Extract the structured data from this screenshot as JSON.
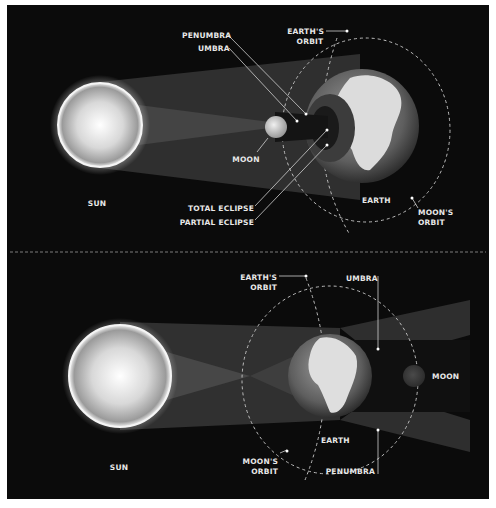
{
  "diagram": {
    "colors": {
      "background": "#0b0b0b",
      "frame": "#ffffff",
      "label": "#e8e8e8",
      "leader_line": "#cfcfcf",
      "penumbra": "#3a3a3a",
      "umbra": "#1a1a1a",
      "orbit": "#bdbdbd"
    },
    "solar_eclipse": {
      "labels": {
        "sun": "SUN",
        "moon": "MOON",
        "earth": "EARTH",
        "penumbra": "PENUMBRA",
        "umbra": "UMBRA",
        "earths_orbit_1": "EARTH'S",
        "earths_orbit_2": "ORBIT",
        "moons_orbit_1": "MOON'S",
        "moons_orbit_2": "ORBIT",
        "total_eclipse": "TOTAL ECLIPSE",
        "partial_eclipse": "PARTIAL ECLIPSE"
      }
    },
    "lunar_eclipse": {
      "labels": {
        "sun": "SUN",
        "moon": "MOON",
        "earth": "EARTH",
        "umbra": "UMBRA",
        "penumbra": "PENUMBRA",
        "earths_orbit_1": "EARTH'S",
        "earths_orbit_2": "ORBIT",
        "moons_orbit_1": "MOON'S",
        "moons_orbit_2": "ORBIT"
      }
    }
  }
}
